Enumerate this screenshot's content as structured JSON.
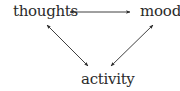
{
  "diagram": {
    "type": "cycle",
    "nodes": [
      {
        "id": "thoughts",
        "label": "thoughts"
      },
      {
        "id": "mood",
        "label": "mood"
      },
      {
        "id": "activity",
        "label": "activity"
      }
    ],
    "edges": [
      {
        "from": "thoughts",
        "to": "mood",
        "direction": "bidirectional"
      },
      {
        "from": "thoughts",
        "to": "activity",
        "direction": "bidirectional"
      },
      {
        "from": "mood",
        "to": "activity",
        "direction": "bidirectional"
      }
    ],
    "colors": {
      "text": "#2a2a2a",
      "arrow": "#2a2a2a",
      "background": "#ffffff"
    }
  }
}
